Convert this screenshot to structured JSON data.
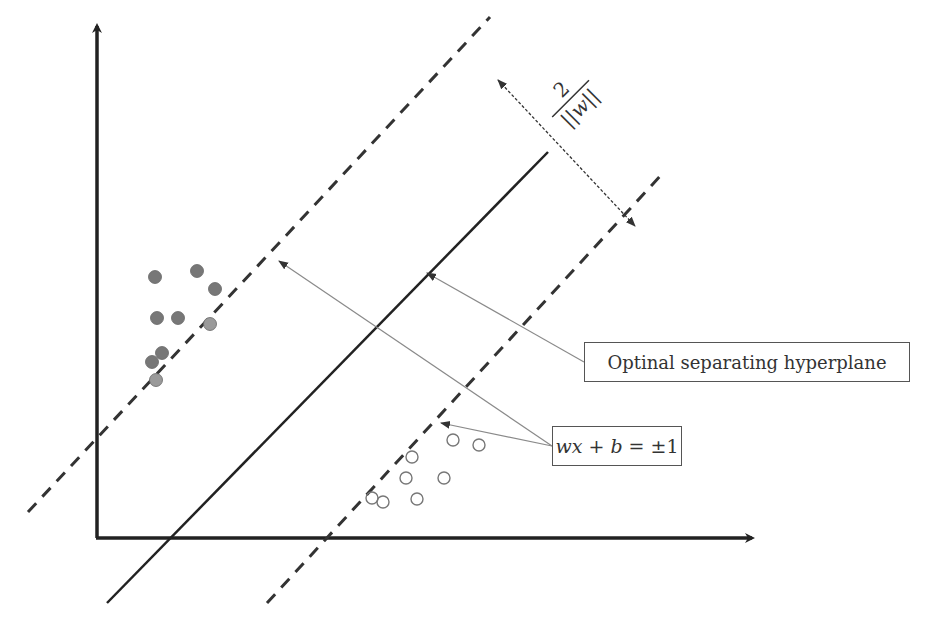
{
  "diagram": {
    "type": "svm-maximum-margin",
    "labels": {
      "hyperplane": "Optinal separating hyperplane",
      "margin_equation": "wx + b = ±1",
      "margin_equation_parts": {
        "lhs": "wx + b",
        "eq": "=",
        "rhs": "±1"
      },
      "margin_width_numerator": "2",
      "margin_width_denominator": "||w||"
    },
    "colors": {
      "axis": "#222222",
      "hyperplane": "#222222",
      "margin_lines": "#333333",
      "pointer_lines": "#8a8a8a",
      "filled_points": "#777777",
      "filled_points_light": "#9a9a9a",
      "hollow_points_stroke": "#777777"
    },
    "filled_points": [
      {
        "x": 155,
        "y": 277
      },
      {
        "x": 197,
        "y": 271
      },
      {
        "x": 215,
        "y": 289
      },
      {
        "x": 157,
        "y": 318
      },
      {
        "x": 178,
        "y": 318
      },
      {
        "x": 210,
        "y": 324
      },
      {
        "x": 162,
        "y": 353
      },
      {
        "x": 152,
        "y": 362
      },
      {
        "x": 156,
        "y": 380
      }
    ],
    "hollow_points": [
      {
        "x": 453,
        "y": 440
      },
      {
        "x": 479,
        "y": 445
      },
      {
        "x": 412,
        "y": 457
      },
      {
        "x": 406,
        "y": 478
      },
      {
        "x": 444,
        "y": 478
      },
      {
        "x": 372,
        "y": 498
      },
      {
        "x": 383,
        "y": 502
      },
      {
        "x": 417,
        "y": 499
      }
    ]
  }
}
